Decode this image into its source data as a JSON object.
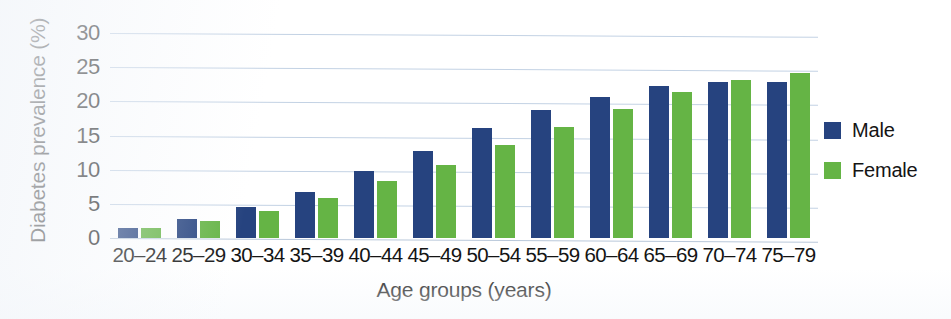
{
  "chart_data": {
    "type": "bar",
    "title": "",
    "xlabel": "Age groups (years)",
    "ylabel": "Diabetes prevalence (%)",
    "ylim": [
      0,
      30
    ],
    "yticks": [
      0,
      5,
      10,
      15,
      20,
      25,
      30
    ],
    "ytick_labels": [
      "0",
      "5",
      "10",
      "15",
      "20",
      "25",
      "30"
    ],
    "grid": true,
    "legend_position": "right",
    "categories": [
      "20–24",
      "25–29",
      "30–34",
      "35–39",
      "40–44",
      "45–49",
      "50–54",
      "55–59",
      "60–64",
      "65–69",
      "70–74",
      "75–79"
    ],
    "series": [
      {
        "name": "Male",
        "color": "#26437f",
        "values": [
          1.5,
          2.8,
          4.5,
          6.8,
          9.8,
          12.8,
          16.1,
          18.8,
          20.7,
          22.2,
          22.9,
          22.8
        ]
      },
      {
        "name": "Female",
        "color": "#65b445",
        "values": [
          1.5,
          2.5,
          4.0,
          5.9,
          8.3,
          10.7,
          13.6,
          16.3,
          18.9,
          21.3,
          23.1,
          24.2
        ]
      }
    ]
  },
  "legend": {
    "items": [
      {
        "label": "Male",
        "color": "#26437f"
      },
      {
        "label": "Female",
        "color": "#65b445"
      }
    ]
  },
  "colors": {
    "male": "#26437f",
    "female": "#65b445",
    "gridline": "#c3d2e4",
    "text": "#141414",
    "background": "#ffffff"
  }
}
